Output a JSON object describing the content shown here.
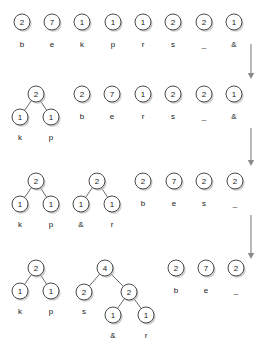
{
  "diagram": {
    "type": "huffman-merge-sequence",
    "colors": {
      "node_fill": "#ffffff",
      "node_stroke": "#4a4a4a",
      "edge": "#6b6b6b",
      "text": "#1a1a1a",
      "arrow": "#8a8a8a",
      "shadow": "#bdbdbd",
      "background": "#ffffff"
    },
    "node_radius": 8,
    "steps": [
      {
        "index": 1,
        "label": "step-1",
        "items": [
          {
            "weight": "2",
            "symbol": "b",
            "x": 22,
            "y": 22,
            "label_y": 45
          },
          {
            "weight": "7",
            "symbol": "e",
            "x": 52,
            "y": 22,
            "label_y": 45
          },
          {
            "weight": "1",
            "symbol": "k",
            "x": 82,
            "y": 22,
            "label_y": 45
          },
          {
            "weight": "1",
            "symbol": "p",
            "x": 113,
            "y": 22,
            "label_y": 45
          },
          {
            "weight": "1",
            "symbol": "r",
            "x": 143,
            "y": 22,
            "label_y": 45
          },
          {
            "weight": "2",
            "symbol": "s",
            "x": 173,
            "y": 22,
            "label_y": 45
          },
          {
            "weight": "2",
            "symbol": "_",
            "x": 204,
            "y": 22,
            "label_y": 45
          },
          {
            "weight": "1",
            "symbol": "&",
            "x": 234,
            "y": 22,
            "label_y": 45
          }
        ],
        "edges": []
      },
      {
        "index": 2,
        "label": "step-2",
        "items": [
          {
            "weight": "2",
            "symbol": "",
            "x": 36,
            "y": 94,
            "label_y": 0
          },
          {
            "weight": "1",
            "symbol": "k",
            "x": 20,
            "y": 117,
            "label_y": 138
          },
          {
            "weight": "1",
            "symbol": "p",
            "x": 51,
            "y": 117,
            "label_y": 138
          },
          {
            "weight": "2",
            "symbol": "b",
            "x": 82,
            "y": 94,
            "label_y": 117
          },
          {
            "weight": "7",
            "symbol": "e",
            "x": 112,
            "y": 94,
            "label_y": 117
          },
          {
            "weight": "1",
            "symbol": "r",
            "x": 143,
            "y": 94,
            "label_y": 117
          },
          {
            "weight": "2",
            "symbol": "s",
            "x": 173,
            "y": 94,
            "label_y": 117
          },
          {
            "weight": "2",
            "symbol": "_",
            "x": 204,
            "y": 94,
            "label_y": 117
          },
          {
            "weight": "1",
            "symbol": "&",
            "x": 234,
            "y": 94,
            "label_y": 117
          }
        ],
        "edges": [
          {
            "x1": 36,
            "y1": 94,
            "x2": 20,
            "y2": 117
          },
          {
            "x1": 36,
            "y1": 94,
            "x2": 51,
            "y2": 117
          }
        ]
      },
      {
        "index": 3,
        "label": "step-3",
        "items": [
          {
            "weight": "2",
            "symbol": "",
            "x": 36,
            "y": 181,
            "label_y": 0
          },
          {
            "weight": "1",
            "symbol": "k",
            "x": 20,
            "y": 204,
            "label_y": 225
          },
          {
            "weight": "1",
            "symbol": "p",
            "x": 51,
            "y": 204,
            "label_y": 225
          },
          {
            "weight": "2",
            "symbol": "",
            "x": 97,
            "y": 181,
            "label_y": 0
          },
          {
            "weight": "1",
            "symbol": "&",
            "x": 81,
            "y": 204,
            "label_y": 225
          },
          {
            "weight": "1",
            "symbol": "r",
            "x": 112,
            "y": 204,
            "label_y": 225
          },
          {
            "weight": "2",
            "symbol": "b",
            "x": 143,
            "y": 181,
            "label_y": 204
          },
          {
            "weight": "7",
            "symbol": "e",
            "x": 174,
            "y": 181,
            "label_y": 204
          },
          {
            "weight": "2",
            "symbol": "s",
            "x": 204,
            "y": 181,
            "label_y": 204
          },
          {
            "weight": "2",
            "symbol": "_",
            "x": 235,
            "y": 181,
            "label_y": 204
          }
        ],
        "edges": [
          {
            "x1": 36,
            "y1": 181,
            "x2": 20,
            "y2": 204
          },
          {
            "x1": 36,
            "y1": 181,
            "x2": 51,
            "y2": 204
          },
          {
            "x1": 97,
            "y1": 181,
            "x2": 81,
            "y2": 204
          },
          {
            "x1": 97,
            "y1": 181,
            "x2": 112,
            "y2": 204
          }
        ]
      },
      {
        "index": 4,
        "label": "step-4",
        "items": [
          {
            "weight": "2",
            "symbol": "",
            "x": 36,
            "y": 268,
            "label_y": 0
          },
          {
            "weight": "1",
            "symbol": "k",
            "x": 20,
            "y": 291,
            "label_y": 312
          },
          {
            "weight": "1",
            "symbol": "p",
            "x": 51,
            "y": 291,
            "label_y": 312
          },
          {
            "weight": "4",
            "symbol": "",
            "x": 105,
            "y": 268,
            "label_y": 0
          },
          {
            "weight": "2",
            "symbol": "s",
            "x": 84,
            "y": 292,
            "label_y": 312
          },
          {
            "weight": "2",
            "symbol": "",
            "x": 129,
            "y": 292,
            "label_y": 0
          },
          {
            "weight": "1",
            "symbol": "&",
            "x": 113,
            "y": 315,
            "label_y": 336
          },
          {
            "weight": "1",
            "symbol": "r",
            "x": 146,
            "y": 315,
            "label_y": 336
          },
          {
            "weight": "2",
            "symbol": "b",
            "x": 176,
            "y": 268,
            "label_y": 291
          },
          {
            "weight": "7",
            "symbol": "e",
            "x": 206,
            "y": 268,
            "label_y": 291
          },
          {
            "weight": "2",
            "symbol": "_",
            "x": 236,
            "y": 268,
            "label_y": 291
          }
        ],
        "edges": [
          {
            "x1": 36,
            "y1": 268,
            "x2": 20,
            "y2": 291
          },
          {
            "x1": 36,
            "y1": 268,
            "x2": 51,
            "y2": 291
          },
          {
            "x1": 105,
            "y1": 268,
            "x2": 84,
            "y2": 292
          },
          {
            "x1": 105,
            "y1": 268,
            "x2": 129,
            "y2": 292
          },
          {
            "x1": 129,
            "y1": 292,
            "x2": 113,
            "y2": 315
          },
          {
            "x1": 129,
            "y1": 292,
            "x2": 146,
            "y2": 315
          }
        ]
      }
    ],
    "arrows": [
      {
        "name": "step-arrow-1",
        "x": 251,
        "y1": 44,
        "y2": 79
      },
      {
        "name": "step-arrow-2",
        "x": 251,
        "y1": 128,
        "y2": 166
      },
      {
        "name": "step-arrow-3",
        "x": 251,
        "y1": 215,
        "y2": 259
      }
    ]
  }
}
